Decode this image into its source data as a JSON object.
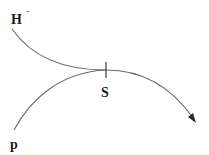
{
  "diagram": {
    "labels": {
      "h": "H",
      "h_sup": "-",
      "s": "S",
      "p": "p"
    },
    "colors": {
      "curve": "#6a6a6a",
      "text": "#1a1a1a",
      "arrow": "#2a2a2a"
    }
  }
}
